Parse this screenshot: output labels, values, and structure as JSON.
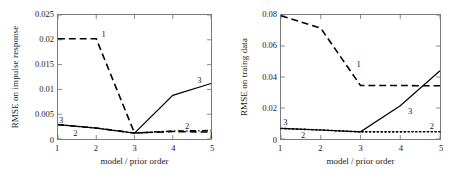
{
  "figure": {
    "background": "#ffffff",
    "axis_color": "#7a7a7a",
    "line_color": "#000000"
  },
  "chart_data": [
    {
      "id": "left",
      "type": "line",
      "title": "",
      "xlabel": "model / prior order",
      "ylabel": "RMSE on impulse response",
      "x": [
        1,
        2,
        3,
        4,
        5
      ],
      "xlim": [
        1,
        5
      ],
      "ylim": [
        0,
        0.025
      ],
      "xticks": [
        1,
        2,
        3,
        4,
        5
      ],
      "xticklabels": [
        "1",
        "2",
        "3",
        "4",
        "5"
      ],
      "yticks": [
        0,
        0.005,
        0.01,
        0.015,
        0.02,
        0.025
      ],
      "yticklabels": [
        "0",
        "0.005",
        "0.01",
        "0.015",
        "0.02",
        "0.025"
      ],
      "grid": false,
      "legend": "inline-curve-labels",
      "series": [
        {
          "name": "1",
          "style": "dashed",
          "values": [
            0.0202,
            0.0202,
            0.0012,
            0.0015,
            0.0014
          ],
          "label": "1",
          "label_x": 2.15,
          "label_y": 0.0208
        },
        {
          "name": "2",
          "style": "dashdot",
          "values": [
            0.0029,
            0.0022,
            0.0012,
            0.0016,
            0.0017
          ],
          "label": "2",
          "label_x": 4.3,
          "label_y": 0.0026
        },
        {
          "name": "3",
          "style": "solid",
          "values": [
            0.0029,
            0.0022,
            0.0012,
            0.0088,
            0.0112
          ],
          "label": "3",
          "label_x": 4.62,
          "label_y": 0.0118
        }
      ],
      "extra_labels": [
        {
          "text": "3",
          "x": 1.05,
          "y": 0.0038
        },
        {
          "text": "2",
          "x": 1.42,
          "y": 0.0012
        },
        {
          "text": "1",
          "x": 4.92,
          "y": 0.0007
        }
      ]
    },
    {
      "id": "right",
      "type": "line",
      "title": "",
      "xlabel": "model / prior order",
      "ylabel": "RMSE on traing data",
      "x": [
        1,
        2,
        3,
        4,
        5
      ],
      "xlim": [
        1,
        5
      ],
      "ylim": [
        0,
        0.08
      ],
      "xticks": [
        1,
        2,
        3,
        4,
        5
      ],
      "xticklabels": [
        "1",
        "2",
        "3",
        "4",
        "5"
      ],
      "yticks": [
        0,
        0.02,
        0.04,
        0.06,
        0.08
      ],
      "yticklabels": [
        "0",
        "0.02",
        "0.04",
        "0.06",
        "0.08"
      ],
      "grid": false,
      "legend": "inline-curve-labels",
      "series": [
        {
          "name": "1",
          "style": "dashed",
          "values": [
            0.0795,
            0.0715,
            0.0345,
            0.0345,
            0.0343
          ],
          "label": "1",
          "label_x": 2.9,
          "label_y": 0.0475
        },
        {
          "name": "2",
          "style": "dotted",
          "values": [
            0.0068,
            0.0058,
            0.0046,
            0.0046,
            0.0047
          ],
          "label": "2",
          "label_x": 4.72,
          "label_y": 0.0085
        },
        {
          "name": "3",
          "style": "solid",
          "values": [
            0.0068,
            0.0058,
            0.0046,
            0.0215,
            0.044
          ],
          "label": "3",
          "label_x": 4.18,
          "label_y": 0.0175
        }
      ],
      "extra_labels": [
        {
          "text": "3",
          "x": 1.08,
          "y": 0.0108
        },
        {
          "text": "2",
          "x": 1.52,
          "y": 0.0026
        }
      ]
    }
  ]
}
